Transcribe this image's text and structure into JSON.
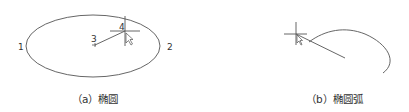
{
  "figure_a": {
    "caption": "（a）椭圆",
    "point_labels": {
      "p1": "1",
      "p2": "2",
      "p3": "3",
      "p4": "4"
    }
  },
  "figure_b": {
    "caption": "（b）椭圆弧"
  },
  "colors": {
    "line": "#555555",
    "text": "#333333"
  }
}
